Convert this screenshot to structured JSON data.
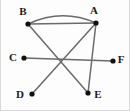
{
  "figure": {
    "width": 130,
    "height": 111,
    "background_color": "#fdfdfd",
    "frame_color": "#d8d8d8",
    "edge_color": "#6a6a6a",
    "vertex_color": "#101010",
    "label_color": "#1c1c1c"
  },
  "graph": {
    "vertices": [
      {
        "id": "A",
        "label": "A",
        "x": 96,
        "y": 23,
        "label_x": 94,
        "label_y": 11
      },
      {
        "id": "B",
        "label": "B",
        "x": 28,
        "y": 24,
        "label_x": 23,
        "label_y": 12
      },
      {
        "id": "C",
        "label": "C",
        "x": 24,
        "y": 58,
        "label_x": 13,
        "label_y": 58
      },
      {
        "id": "D",
        "label": "D",
        "x": 32,
        "y": 94,
        "label_x": 20,
        "label_y": 95
      },
      {
        "id": "E",
        "label": "E",
        "x": 88,
        "y": 93,
        "label_x": 98,
        "label_y": 95
      },
      {
        "id": "F",
        "label": "F",
        "x": 113,
        "y": 61,
        "label_x": 121,
        "label_y": 60
      }
    ],
    "edges": [
      {
        "id": "B-A-arc",
        "from": "B",
        "to": "A",
        "shape": "curve",
        "ctrl_x": 62,
        "ctrl_y": 8
      },
      {
        "id": "B-A-straight",
        "from": "B",
        "to": "A",
        "shape": "line"
      },
      {
        "id": "B-E",
        "from": "B",
        "to": "E",
        "shape": "line"
      },
      {
        "id": "A-D",
        "from": "A",
        "to": "D",
        "shape": "line"
      },
      {
        "id": "A-E",
        "from": "A",
        "to": "E",
        "shape": "line"
      },
      {
        "id": "C-F",
        "from": "C",
        "to": "F",
        "shape": "line"
      }
    ],
    "vertex_count": 6,
    "edge_count": 6
  }
}
